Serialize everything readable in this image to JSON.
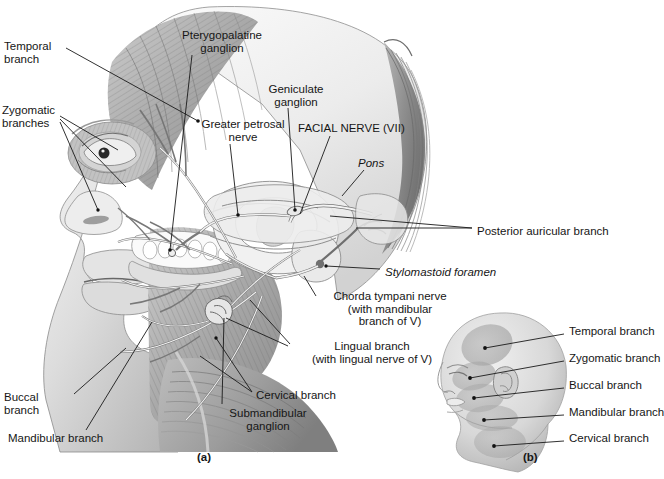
{
  "figure": {
    "panels": [
      {
        "id": "a",
        "caption": "(a)"
      },
      {
        "id": "b",
        "caption": "(b)"
      }
    ]
  },
  "panel_a": {
    "caption": "(a)",
    "labels": [
      {
        "name": "temporal-branch",
        "text": "Temporal\nbranch",
        "italic": false,
        "align": "left",
        "x": 4,
        "y": 40
      },
      {
        "name": "zygomatic-branches",
        "text": "Zygomatic\nbranches",
        "italic": false,
        "align": "left",
        "x": 2,
        "y": 104
      },
      {
        "name": "pterygopalatine-ganglion",
        "text": "Pterygopalatine\nganglion",
        "italic": false,
        "align": "center",
        "x": 167,
        "y": 29
      },
      {
        "name": "geniculate-ganglion",
        "text": "Geniculate\nganglion",
        "italic": false,
        "align": "center",
        "x": 254,
        "y": 83
      },
      {
        "name": "greater-petrosal-nerve",
        "text": "Greater petrosal\nnerve",
        "italic": false,
        "align": "center",
        "x": 191,
        "y": 118
      },
      {
        "name": "facial-nerve-vii",
        "text": "FACIAL NERVE (VII)",
        "italic": false,
        "align": "left",
        "x": 298,
        "y": 122
      },
      {
        "name": "pons",
        "text": "Pons",
        "italic": true,
        "align": "left",
        "x": 358,
        "y": 157
      },
      {
        "name": "posterior-auricular-branch",
        "text": "Posterior auricular branch",
        "italic": false,
        "align": "left",
        "x": 477,
        "y": 225
      },
      {
        "name": "stylomastoid-foramen",
        "text": "Stylomastoid foramen",
        "italic": true,
        "align": "left",
        "x": 385,
        "y": 266
      },
      {
        "name": "chorda-tympani-nerve",
        "text": "Chorda tympani nerve\n(with mandibular\nbranch of V)",
        "italic": false,
        "align": "center",
        "x": 320,
        "y": 290
      },
      {
        "name": "lingual-branch",
        "text": "Lingual branch\n(with lingual nerve of V)",
        "italic": false,
        "align": "center",
        "x": 292,
        "y": 340
      },
      {
        "name": "cervical-branch",
        "text": "Cervical branch",
        "italic": false,
        "align": "left",
        "x": 256,
        "y": 389
      },
      {
        "name": "submandibular-ganglion",
        "text": "Submandibular\nganglion",
        "italic": false,
        "align": "center",
        "x": 218,
        "y": 407
      },
      {
        "name": "mandibular-branch",
        "text": "Mandibular branch",
        "italic": false,
        "align": "left",
        "x": 8,
        "y": 432
      },
      {
        "name": "buccal-branch",
        "text": "Buccal\nbranch",
        "italic": false,
        "align": "left",
        "x": 4,
        "y": 391
      }
    ]
  },
  "panel_b": {
    "caption": "(b)",
    "labels": [
      {
        "name": "temporal-branch",
        "text": "Temporal branch",
        "x": 569,
        "y": 331
      },
      {
        "name": "zygomatic-branch",
        "text": "Zygomatic branch",
        "x": 569,
        "y": 358
      },
      {
        "name": "buccal-branch",
        "text": "Buccal branch",
        "x": 569,
        "y": 385
      },
      {
        "name": "mandibular-branch",
        "text": "Mandibular branch",
        "x": 569,
        "y": 412
      },
      {
        "name": "cervical-branch",
        "text": "Cervical branch",
        "x": 569,
        "y": 438
      }
    ]
  },
  "colors": {
    "background": "#ffffff",
    "ink": "#161616",
    "leader_line": "#1a1a1a",
    "tissue_light": "#e9e9e9",
    "tissue_mid": "#c9c9c9",
    "tissue_dark": "#9a9a9a",
    "tissue_shadow": "#6d6d6d",
    "nerve": "#f2f2f2",
    "bone": "#fbfbfb"
  }
}
